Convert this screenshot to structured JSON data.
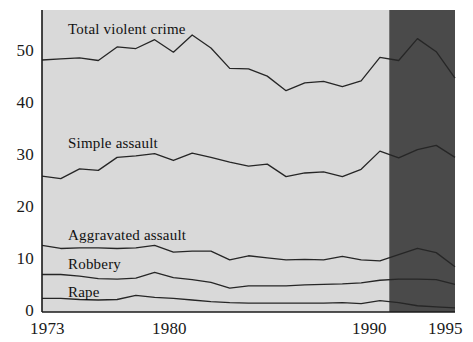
{
  "chart_data": {
    "type": "area",
    "title": "",
    "subtitle": "",
    "xlabel": "",
    "ylabel": "",
    "xlim": [
      1973,
      1995
    ],
    "ylim": [
      0,
      58
    ],
    "grid": false,
    "legend_position": "inline-annotations",
    "stacked": true,
    "x": [
      1973,
      1974,
      1975,
      1976,
      1977,
      1978,
      1979,
      1980,
      1981,
      1982,
      1983,
      1984,
      1985,
      1986,
      1987,
      1988,
      1989,
      1990,
      1991,
      1992,
      1993,
      1994,
      1995
    ],
    "xticks": [
      1973,
      1980,
      1990,
      1995
    ],
    "xticklabels": [
      "1973",
      "1980",
      "1990",
      "1995"
    ],
    "yticks": [
      0,
      10,
      20,
      30,
      40,
      50
    ],
    "yticklabels": [
      "0",
      "10",
      "20",
      "30",
      "40",
      "50"
    ],
    "series": [
      {
        "name": "Rape",
        "label": "Rape",
        "cumulative_values": [
          2.6,
          2.6,
          2.4,
          2.3,
          2.4,
          3.2,
          2.8,
          2.6,
          2.3,
          2.0,
          1.8,
          1.7,
          1.7,
          1.7,
          1.7,
          1.7,
          1.8,
          1.6,
          2.2,
          1.8,
          1.2,
          1.0,
          0.8
        ]
      },
      {
        "name": "Robbery",
        "label": "Robbery",
        "cumulative_values": [
          7.2,
          7.2,
          6.9,
          6.4,
          6.3,
          6.5,
          7.6,
          6.6,
          6.2,
          5.7,
          4.6,
          5.0,
          5.0,
          5.0,
          5.2,
          5.3,
          5.4,
          5.6,
          6.1,
          6.3,
          6.3,
          6.2,
          5.3
        ]
      },
      {
        "name": "Aggravated assault",
        "label": "Aggravated assault",
        "cumulative_values": [
          12.8,
          12.2,
          12.3,
          12.3,
          12.2,
          12.3,
          12.8,
          11.5,
          11.7,
          11.7,
          10.0,
          10.8,
          10.4,
          10.0,
          10.1,
          10.0,
          10.7,
          10.0,
          9.8,
          11.0,
          12.2,
          11.4,
          8.7
        ]
      },
      {
        "name": "Simple assault",
        "label": "Simple assault",
        "cumulative_values": [
          26.1,
          25.6,
          27.5,
          27.2,
          29.7,
          30.0,
          30.4,
          29.1,
          30.5,
          29.7,
          28.8,
          28.0,
          28.4,
          26.0,
          26.7,
          26.9,
          26.0,
          27.4,
          30.9,
          29.6,
          31.2,
          32.0,
          29.7
        ]
      },
      {
        "name": "Total violent crime",
        "label": "Total violent crime",
        "cumulative_values": [
          48.4,
          48.6,
          48.8,
          48.3,
          50.9,
          50.6,
          52.3,
          49.9,
          53.2,
          50.7,
          46.8,
          46.7,
          45.3,
          42.5,
          44.0,
          44.3,
          43.3,
          44.4,
          48.9,
          48.3,
          52.5,
          50.0,
          44.9
        ]
      }
    ],
    "annotations": [
      {
        "id": "redesign-shading",
        "label": "",
        "type": "vertical-band",
        "x_start": 1991.5,
        "x_end": 1995,
        "color": "#4a4a4a"
      }
    ],
    "colors": {
      "plot_background": "#d9d9d9",
      "shaded_band": "#4a4a4a",
      "line": "#262626",
      "axis": "#1a1a1a",
      "text": "#1a1a1a"
    }
  },
  "yticks": [
    {
      "label": "50",
      "top": 149
    },
    {
      "label": "40",
      "top": 201
    },
    {
      "label": "30",
      "top": 253
    },
    {
      "label": "20",
      "top": 305
    },
    {
      "label": "10",
      "top": 357
    },
    {
      "label": "0",
      "top": 409
    }
  ],
  "xticks": [
    {
      "label": "1973",
      "left": 42
    },
    {
      "label": "1980",
      "left": 140
    },
    {
      "label": "1990",
      "left": 340
    },
    {
      "label": "1995",
      "left": 434
    }
  ],
  "series_labels": [
    {
      "name": "Total violent crime",
      "left": 66,
      "top": 22
    },
    {
      "name": "Simple assault",
      "left": 66,
      "top": 136
    },
    {
      "name": "Aggravated assault",
      "left": 66,
      "top": 228
    },
    {
      "name": "Robbery",
      "left": 66,
      "top": 257
    },
    {
      "name": "Rape",
      "left": 66,
      "top": 285
    }
  ]
}
